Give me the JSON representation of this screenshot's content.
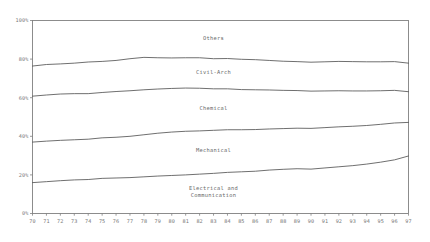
{
  "chart_data": {
    "type": "area",
    "title": "",
    "xlabel": "",
    "ylabel": "",
    "grid": false,
    "legend_position": "inline-labels",
    "stacked": true,
    "percent_axis": true,
    "ylim": [
      0,
      100
    ],
    "yticks": [
      0,
      20,
      40,
      60,
      80,
      100
    ],
    "ytick_labels": [
      "0%",
      "20%",
      "40%",
      "60%",
      "80%",
      "100%"
    ],
    "x": [
      70,
      71,
      72,
      73,
      74,
      75,
      76,
      77,
      78,
      79,
      80,
      81,
      82,
      83,
      84,
      85,
      86,
      87,
      88,
      89,
      90,
      91,
      92,
      93,
      94,
      95,
      96,
      97
    ],
    "xtick_labels": [
      "70",
      "71",
      "72",
      "73",
      "74",
      "75",
      "76",
      "77",
      "78",
      "79",
      "80",
      "81",
      "82",
      "83",
      "84",
      "85",
      "86",
      "87",
      "88",
      "89",
      "90",
      "91",
      "92",
      "93",
      "94",
      "95",
      "96",
      "97"
    ],
    "series": [
      {
        "name": "Electrical and Communication",
        "label_lines": [
          "Electrical and",
          "Communication"
        ],
        "values": [
          16.0,
          16.5,
          17.0,
          17.4,
          17.6,
          18.2,
          18.4,
          18.6,
          19.0,
          19.4,
          19.7,
          20.0,
          20.4,
          20.8,
          21.3,
          21.6,
          21.9,
          22.5,
          22.9,
          23.2,
          23.0,
          23.6,
          24.2,
          24.8,
          25.6,
          26.6,
          27.8,
          29.8
        ]
      },
      {
        "name": "Mechanical",
        "label_lines": [
          "Mechanical"
        ],
        "values": [
          21.0,
          21.0,
          20.9,
          20.8,
          20.9,
          21.0,
          21.1,
          21.4,
          21.8,
          22.2,
          22.5,
          22.6,
          22.4,
          22.3,
          22.1,
          21.8,
          21.6,
          21.3,
          21.1,
          21.0,
          21.1,
          20.9,
          20.7,
          20.4,
          20.0,
          19.6,
          19.1,
          17.4
        ]
      },
      {
        "name": "Chemical",
        "label_lines": [
          "Chemical"
        ],
        "values": [
          23.8,
          23.9,
          24.0,
          23.9,
          23.6,
          23.5,
          23.7,
          23.6,
          23.3,
          22.9,
          22.6,
          22.4,
          22.1,
          21.5,
          21.2,
          20.8,
          20.6,
          20.2,
          19.8,
          19.5,
          19.3,
          19.0,
          18.7,
          18.3,
          17.9,
          17.4,
          16.9,
          15.9
        ]
      },
      {
        "name": "Civil-Arch",
        "label_lines": [
          "Civil-Arch"
        ],
        "values": [
          15.6,
          15.8,
          15.6,
          15.8,
          16.4,
          16.1,
          16.1,
          16.6,
          16.8,
          16.2,
          15.8,
          15.7,
          15.8,
          15.6,
          15.7,
          15.7,
          15.6,
          15.3,
          15.1,
          15.0,
          15.0,
          15.1,
          15.2,
          15.2,
          15.1,
          15.0,
          14.9,
          14.8
        ]
      },
      {
        "name": "Others",
        "label_lines": [
          "Others"
        ],
        "values": [
          23.6,
          22.8,
          22.5,
          22.1,
          21.5,
          21.2,
          20.7,
          19.8,
          19.1,
          19.3,
          19.4,
          19.3,
          19.3,
          19.8,
          19.7,
          20.1,
          20.3,
          20.7,
          21.1,
          21.3,
          21.6,
          21.4,
          21.2,
          21.3,
          21.4,
          21.4,
          21.3,
          22.1
        ]
      }
    ],
    "colors": {
      "line": "#555555",
      "frame": "#808080",
      "tick_text": "#777777",
      "label_text": "#6a6a6a",
      "background": "#ffffff"
    }
  }
}
